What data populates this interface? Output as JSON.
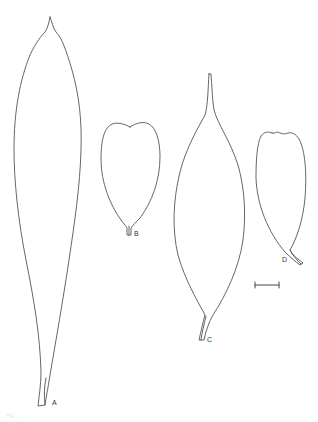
{
  "figure": {
    "stroke_color": "#555555",
    "background": "#ffffff",
    "leaves": [
      {
        "id": "A",
        "label": "A",
        "shape": "long narrow lanceolate, acuminate tip"
      },
      {
        "id": "B",
        "label": "B",
        "shape": "obovate with notched (emarginate) apex"
      },
      {
        "id": "C",
        "label": "C",
        "shape": "elliptic with long attenuate tip"
      },
      {
        "id": "D",
        "label": "D",
        "shape": "obovate with slightly notched apex, curved petiole"
      }
    ],
    "scale_bar": {
      "present": true
    },
    "caption": "Fig. ..."
  }
}
